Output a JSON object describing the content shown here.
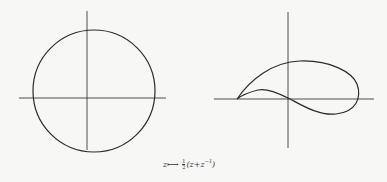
{
  "figure": {
    "left_panel": {
      "description": "unit circle in the z-plane with coordinate axes",
      "shape": "circle"
    },
    "right_panel": {
      "description": "image of offset circle under Joukowski map: airfoil shape with cusp",
      "shape": "airfoil"
    },
    "caption": {
      "var": "z",
      "arrow": "⟼",
      "frac_num": "1",
      "frac_den": "2",
      "expr_open": "(z+z",
      "exponent": "−1",
      "expr_close": ")"
    },
    "colors": {
      "stroke": "#2a2a2a",
      "axis": "#3a3a3a",
      "background": "#f7f7f5"
    }
  }
}
